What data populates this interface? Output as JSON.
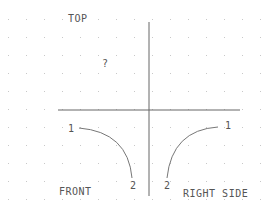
{
  "diagram": {
    "type": "orthographic-projection-sketch",
    "views": {
      "top": {
        "label": "TOP",
        "content": "?"
      },
      "front": {
        "label": "FRONT",
        "curve_start_label": "1",
        "curve_end_label": "2"
      },
      "right_side": {
        "label": "RIGHT SIDE",
        "curve_start_label": "1",
        "curve_end_label": "2"
      }
    },
    "colors": {
      "background": "#ffffff",
      "line": "#555555",
      "grid_dot": "#c8c8c8",
      "text": "#555555"
    }
  }
}
